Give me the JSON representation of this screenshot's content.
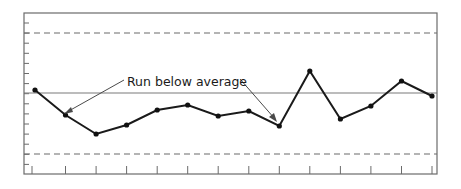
{
  "chart_data": {
    "type": "line",
    "title": "",
    "xlabel": "",
    "ylabel": "",
    "x": [
      1,
      2,
      3,
      4,
      5,
      6,
      7,
      8,
      9,
      10,
      11,
      12,
      13,
      14
    ],
    "series": [
      {
        "name": "Process measurement",
        "values": [
          0.3,
          -2.2,
          -4.1,
          -3.2,
          -1.7,
          -1.2,
          -2.3,
          -1.8,
          -3.3,
          2.2,
          -2.6,
          -1.3,
          1.2,
          -0.3
        ]
      }
    ],
    "reference_lines": [
      {
        "name": "Upper control limit",
        "value": 6.0,
        "style": "dashed"
      },
      {
        "name": "Average (center line)",
        "value": 0.0,
        "style": "solid"
      },
      {
        "name": "Lower control limit",
        "value": -6.1,
        "style": "dashed"
      }
    ],
    "annotations": [
      {
        "text": "Run below average",
        "points_to": [
          2,
          9
        ]
      }
    ],
    "ylim": [
      -8.1,
      8.0
    ],
    "grid": false,
    "legend": "none",
    "colors": {
      "line": "#1a1a1a",
      "frame": "#6b6b6b",
      "limits": "#6b6b6b"
    }
  },
  "annotation": {
    "label": "Run below average"
  }
}
